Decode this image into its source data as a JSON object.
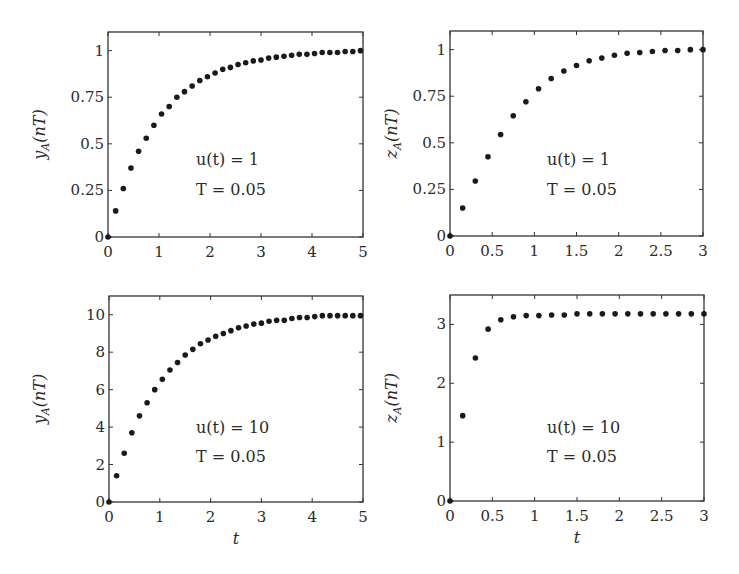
{
  "chart_data": [
    {
      "type": "scatter",
      "position": "top-left",
      "ylabel": "y_A(nT)",
      "ylabel_main": "y",
      "ylabel_sub": "A",
      "ylabel_arg": "(nT)",
      "xlabel": "",
      "xlim": [
        0,
        5
      ],
      "ylim": [
        0,
        1.1
      ],
      "xticks": [
        0,
        1,
        2,
        3,
        4,
        5
      ],
      "yticks": [
        0,
        0.25,
        0.5,
        0.75,
        1
      ],
      "ytick_labels": [
        "0",
        "0.25",
        "0.5",
        "0.75",
        "1"
      ],
      "xtick_labels": [
        "0",
        "1",
        "2",
        "3",
        "4",
        "5"
      ],
      "annotation": [
        "u(t) = 1",
        "T = 0.05"
      ],
      "grid": false,
      "x": [
        0,
        0.15,
        0.3,
        0.45,
        0.6,
        0.75,
        0.9,
        1.05,
        1.2,
        1.35,
        1.5,
        1.65,
        1.8,
        1.95,
        2.1,
        2.25,
        2.4,
        2.55,
        2.7,
        2.85,
        3.0,
        3.15,
        3.3,
        3.45,
        3.6,
        3.75,
        3.9,
        4.05,
        4.2,
        4.35,
        4.5,
        4.65,
        4.8,
        4.95
      ],
      "y": [
        0,
        0.14,
        0.26,
        0.37,
        0.46,
        0.53,
        0.6,
        0.66,
        0.7,
        0.75,
        0.78,
        0.81,
        0.84,
        0.86,
        0.88,
        0.9,
        0.91,
        0.925,
        0.935,
        0.945,
        0.95,
        0.96,
        0.965,
        0.97,
        0.975,
        0.98,
        0.98,
        0.985,
        0.99,
        0.99,
        0.99,
        0.995,
        0.995,
        1.0
      ]
    },
    {
      "type": "scatter",
      "position": "top-right",
      "ylabel": "z_A(nT)",
      "ylabel_main": "z",
      "ylabel_sub": "A",
      "ylabel_arg": "(nT)",
      "xlabel": "",
      "xlim": [
        0,
        3
      ],
      "ylim": [
        0,
        1.1
      ],
      "xticks": [
        0,
        0.5,
        1,
        1.5,
        2,
        2.5,
        3
      ],
      "xtick_labels": [
        "0",
        "0.5",
        "1",
        "1.5",
        "2",
        "2.5",
        "3"
      ],
      "yticks": [
        0,
        0.25,
        0.5,
        0.75,
        1
      ],
      "ytick_labels": [
        "0",
        "0.25",
        "0.5",
        "0.75",
        "1"
      ],
      "annotation": [
        "u(t) = 1",
        "T = 0.05"
      ],
      "grid": false,
      "x": [
        0,
        0.15,
        0.3,
        0.45,
        0.6,
        0.75,
        0.9,
        1.05,
        1.2,
        1.35,
        1.5,
        1.65,
        1.8,
        1.95,
        2.1,
        2.25,
        2.4,
        2.55,
        2.7,
        2.85,
        3.0
      ],
      "y": [
        0,
        0.15,
        0.295,
        0.425,
        0.545,
        0.645,
        0.72,
        0.79,
        0.845,
        0.885,
        0.915,
        0.94,
        0.955,
        0.97,
        0.98,
        0.985,
        0.99,
        0.995,
        0.995,
        1.0,
        1.0
      ]
    },
    {
      "type": "scatter",
      "position": "bottom-left",
      "ylabel": "y_A(nT)",
      "ylabel_main": "y",
      "ylabel_sub": "A",
      "ylabel_arg": "(nT)",
      "xlabel": "t",
      "xlim": [
        0,
        5
      ],
      "ylim": [
        0,
        11
      ],
      "xticks": [
        0,
        1,
        2,
        3,
        4,
        5
      ],
      "xtick_labels": [
        "0",
        "1",
        "2",
        "3",
        "4",
        "5"
      ],
      "yticks": [
        0,
        2,
        4,
        6,
        8,
        10
      ],
      "ytick_labels": [
        "0",
        "2",
        "4",
        "6",
        "8",
        "10"
      ],
      "annotation": [
        "u(t) = 10",
        "T = 0.05"
      ],
      "grid": false,
      "x": [
        0,
        0.15,
        0.3,
        0.45,
        0.6,
        0.75,
        0.9,
        1.05,
        1.2,
        1.35,
        1.5,
        1.65,
        1.8,
        1.95,
        2.1,
        2.25,
        2.4,
        2.55,
        2.7,
        2.85,
        3.0,
        3.15,
        3.3,
        3.45,
        3.6,
        3.75,
        3.9,
        4.05,
        4.2,
        4.35,
        4.5,
        4.65,
        4.8,
        4.95
      ],
      "y": [
        0,
        1.4,
        2.6,
        3.7,
        4.6,
        5.3,
        6.0,
        6.55,
        7.05,
        7.45,
        7.85,
        8.15,
        8.45,
        8.65,
        8.85,
        9.0,
        9.15,
        9.3,
        9.4,
        9.5,
        9.55,
        9.65,
        9.7,
        9.7,
        9.8,
        9.85,
        9.85,
        9.9,
        9.95,
        9.95,
        9.95,
        9.95,
        9.95,
        9.95
      ]
    },
    {
      "type": "scatter",
      "position": "bottom-right",
      "ylabel": "z_A(nT)",
      "ylabel_main": "z",
      "ylabel_sub": "A",
      "ylabel_arg": "(nT)",
      "xlabel": "t",
      "xlim": [
        0,
        3
      ],
      "ylim": [
        0,
        3.5
      ],
      "xticks": [
        0,
        0.5,
        1,
        1.5,
        2,
        2.5,
        3
      ],
      "xtick_labels": [
        "0",
        "0.5",
        "1",
        "1.5",
        "2",
        "2.5",
        "3"
      ],
      "yticks": [
        0,
        1,
        2,
        3
      ],
      "ytick_labels": [
        "0",
        "1",
        "2",
        "3"
      ],
      "annotation": [
        "u(t) = 10",
        "T = 0.05"
      ],
      "grid": false,
      "x": [
        0,
        0.15,
        0.3,
        0.45,
        0.6,
        0.75,
        0.9,
        1.05,
        1.2,
        1.35,
        1.5,
        1.65,
        1.8,
        1.95,
        2.1,
        2.25,
        2.4,
        2.55,
        2.7,
        2.85,
        3.0
      ],
      "y": [
        0,
        1.45,
        2.43,
        2.92,
        3.08,
        3.13,
        3.15,
        3.15,
        3.16,
        3.16,
        3.18,
        3.18,
        3.18,
        3.18,
        3.18,
        3.18,
        3.18,
        3.18,
        3.18,
        3.18,
        3.18
      ]
    }
  ],
  "layout": {
    "panels": [
      {
        "left": 108,
        "top": 32,
        "right": 363,
        "bottom": 237,
        "annot_x": 196,
        "annot_y1": 165,
        "annot_y2": 195,
        "ylabel_x": 45
      },
      {
        "left": 450,
        "top": 31,
        "right": 703,
        "bottom": 236,
        "annot_x": 547,
        "annot_y1": 165,
        "annot_y2": 195,
        "ylabel_x": 397
      },
      {
        "left": 109,
        "top": 296,
        "right": 363,
        "bottom": 502,
        "annot_x": 196,
        "annot_y1": 433,
        "annot_y2": 462,
        "ylabel_x": 45
      },
      {
        "left": 450,
        "top": 295,
        "right": 704,
        "bottom": 501,
        "annot_x": 547,
        "annot_y1": 433,
        "annot_y2": 462,
        "ylabel_x": 397
      }
    ]
  },
  "colors": {
    "axis": "#333333",
    "marker": "#1a1a1a",
    "text": "#2a2a2a"
  }
}
